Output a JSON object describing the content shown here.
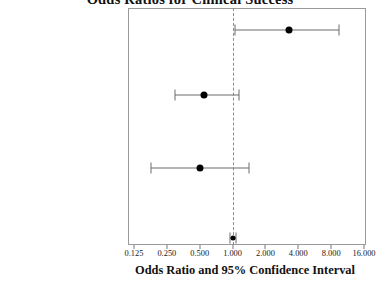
{
  "chart_data": {
    "type": "scatter",
    "title": "Odds Ratios for Clinical Success",
    "subtitle": "",
    "xlabel": "Odds Ratio and 95% Confidence Interval",
    "ylabel": "",
    "xscale": "log2",
    "xlim": [
      0.125,
      16.0
    ],
    "grid": false,
    "legend": null,
    "reference_line": 1.0,
    "xticks": [
      0.125,
      0.25,
      0.5,
      1.0,
      2.0,
      4.0,
      8.0,
      16.0
    ],
    "xticklabels": [
      "0.125",
      "0.250",
      "0.500",
      "1.000",
      "2.000",
      "4.000",
      "8.000",
      "16.000"
    ],
    "categories": [
      "Active Therapy vs. Placebo",
      "White vs. Black",
      "Male vs. Female",
      "Baseline Pain (continuous)"
    ],
    "series": [
      {
        "name": "Odds Ratio",
        "values": [
          3.3,
          0.55,
          0.5,
          1.0
        ],
        "ci_lower": [
          1.05,
          0.3,
          0.18,
          0.94
        ],
        "ci_upper": [
          9.5,
          1.15,
          1.4,
          1.07
        ]
      }
    ],
    "annotations": []
  },
  "chart": {
    "title": "Odds Ratios for Clinical Success",
    "axis_title": "Odds Ratio and 95% Confidence Interval",
    "rows": [
      {
        "label": "Active Therapy vs. Placebo",
        "estimate": 3.3,
        "lower": 1.05,
        "upper": 9.5
      },
      {
        "label": "White vs. Black",
        "estimate": 0.55,
        "lower": 0.3,
        "upper": 1.15
      },
      {
        "label": "Male vs. Female",
        "estimate": 0.5,
        "lower": 0.18,
        "upper": 1.4
      },
      {
        "label": "Baseline Pain (continuous)",
        "estimate": 1.0,
        "lower": 0.94,
        "upper": 1.07
      }
    ],
    "ticks": [
      {
        "value": 0.125,
        "label": "0.125"
      },
      {
        "value": 0.25,
        "label": "0.250"
      },
      {
        "value": 0.5,
        "label": "0.500"
      },
      {
        "value": 1.0,
        "label": "1.000"
      },
      {
        "value": 2.0,
        "label": "2.000"
      },
      {
        "value": 4.0,
        "label": "4.000"
      },
      {
        "value": 8.0,
        "label": "8.000"
      },
      {
        "value": 16.0,
        "label": "16.000"
      }
    ],
    "colors": {
      "point": "#000000",
      "line": "#6d6d6d",
      "frame": "#9a9a9a",
      "reference": "#8d8d8d",
      "text": "#111111"
    }
  }
}
